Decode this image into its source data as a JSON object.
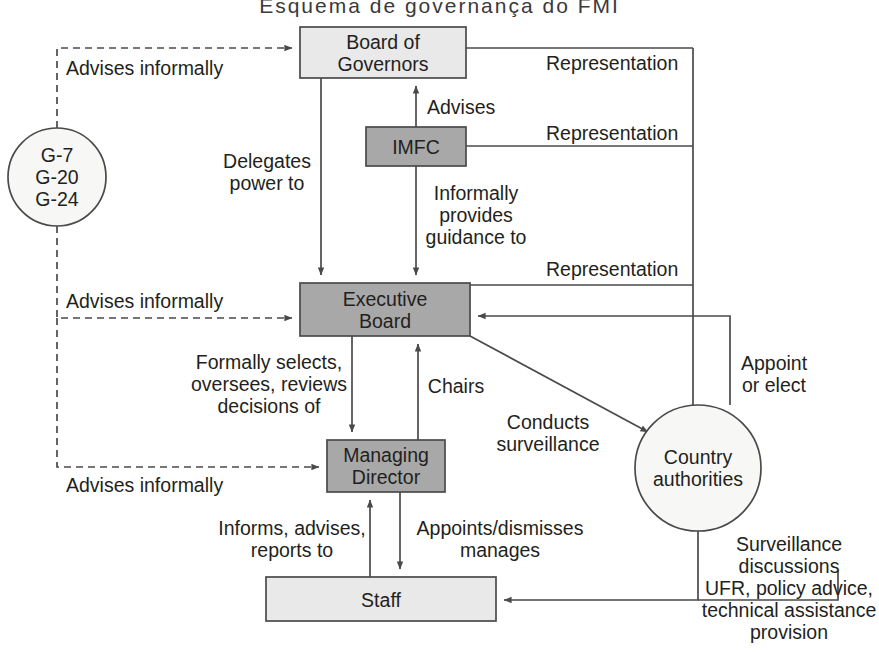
{
  "title": "Esquema de governança do FMI",
  "colors": {
    "box_light": "#e9e9e9",
    "box_dark": "#a8a8a8",
    "stroke": "#4a4a4a",
    "text": "#231f20",
    "circle_fill": "#f7f7f5",
    "background": "#ffffff"
  },
  "nodes": [
    {
      "id": "board-of-governors",
      "label": "Board of\nGovernors",
      "shape": "rect",
      "fill": "light",
      "x": 300,
      "y": 27,
      "w": 166,
      "h": 51
    },
    {
      "id": "imfc",
      "label": "IMFC",
      "shape": "rect",
      "fill": "dark",
      "x": 366,
      "y": 127,
      "w": 100,
      "h": 39
    },
    {
      "id": "executive-board",
      "label": "Executive\nBoard",
      "shape": "rect",
      "fill": "dark",
      "x": 300,
      "y": 283,
      "w": 170,
      "h": 53
    },
    {
      "id": "managing-director",
      "label": "Managing\nDirector",
      "shape": "rect",
      "fill": "dark",
      "x": 327,
      "y": 440,
      "w": 118,
      "h": 52
    },
    {
      "id": "staff",
      "label": "Staff",
      "shape": "rect",
      "fill": "light",
      "x": 266,
      "y": 577,
      "w": 230,
      "h": 44
    },
    {
      "id": "g-groups",
      "label": "G-7\nG-20\nG-24",
      "shape": "circle",
      "fill": "circle",
      "cx": 57,
      "cy": 177,
      "r": 49
    },
    {
      "id": "country-authorities",
      "label": "Country\nauthorities",
      "shape": "circle",
      "fill": "circle",
      "cx": 698,
      "cy": 468,
      "r": 63
    }
  ],
  "edge_labels": [
    {
      "id": "advises-informally-governors",
      "text": "Advises informally",
      "x": 66,
      "y": 57,
      "align": "l"
    },
    {
      "id": "advises-informally-executive-board",
      "text": "Advises informally",
      "x": 66,
      "y": 290,
      "align": "l"
    },
    {
      "id": "advises-informally-managing-director",
      "text": "Advises informally",
      "x": 66,
      "y": 474,
      "align": "l"
    },
    {
      "id": "representation-governors",
      "text": "Representation",
      "x": 546,
      "y": 52,
      "align": "l"
    },
    {
      "id": "representation-imfc",
      "text": "Representation",
      "x": 546,
      "y": 122,
      "align": "l"
    },
    {
      "id": "representation-executive-board",
      "text": "Representation",
      "x": 546,
      "y": 258,
      "align": "l"
    },
    {
      "id": "advises-imfc-to-governors",
      "text": "Advises",
      "x": 427,
      "y": 96,
      "align": "l"
    },
    {
      "id": "delegates-power-to",
      "text": "Delegates\npower to",
      "x": 267,
      "y": 150,
      "align": "c"
    },
    {
      "id": "informally-provides-guidance-to",
      "text": "Informally\nprovides\nguidance to",
      "x": 476,
      "y": 182,
      "align": "c"
    },
    {
      "id": "formally-selects-oversees-reviews",
      "text": "Formally selects,\noversees, reviews\ndecisions of",
      "x": 269,
      "y": 351,
      "align": "c"
    },
    {
      "id": "chairs",
      "text": "Chairs",
      "x": 456,
      "y": 375,
      "align": "c"
    },
    {
      "id": "conducts-surveillance",
      "text": "Conducts\nsurveillance",
      "x": 548,
      "y": 411,
      "align": "c"
    },
    {
      "id": "appoint-or-elect",
      "text": "Appoint\nor elect",
      "x": 774,
      "y": 352,
      "align": "c"
    },
    {
      "id": "informs-advises-reports-to",
      "text": "Informs, advises,\nreports to",
      "x": 292,
      "y": 517,
      "align": "c"
    },
    {
      "id": "appoints-dismisses-manages",
      "text": "Appoints/dismisses\nmanages",
      "x": 500,
      "y": 517,
      "align": "c"
    },
    {
      "id": "surveillance-discussions",
      "text": "Surveillance\ndiscussions\nUFR, policy advice,\ntechnical assistance\nprovision",
      "x": 789,
      "y": 533,
      "align": "c"
    }
  ],
  "edges": [
    {
      "id": "g-to-board-of-governors",
      "style": "dashed",
      "from": "g-groups",
      "to": "board-of-governors"
    },
    {
      "id": "g-to-executive-board",
      "style": "dashed",
      "from": "g-groups",
      "to": "executive-board"
    },
    {
      "id": "g-to-managing-director",
      "style": "dashed",
      "from": "g-groups",
      "to": "managing-director"
    },
    {
      "id": "board-of-governors-to-executive-board",
      "style": "solid",
      "from": "board-of-governors",
      "to": "executive-board"
    },
    {
      "id": "imfc-to-board-of-governors",
      "style": "solid",
      "from": "imfc",
      "to": "board-of-governors"
    },
    {
      "id": "imfc-to-executive-board",
      "style": "solid",
      "from": "imfc",
      "to": "executive-board"
    },
    {
      "id": "board-of-governors-to-country-authorities",
      "style": "solid",
      "from": "board-of-governors",
      "to": "country-authorities"
    },
    {
      "id": "imfc-to-country-authorities",
      "style": "solid",
      "from": "imfc",
      "to": "country-authorities"
    },
    {
      "id": "executive-board-to-country-authorities",
      "style": "solid",
      "from": "executive-board",
      "to": "country-authorities"
    },
    {
      "id": "country-authorities-to-executive-board",
      "style": "solid",
      "from": "country-authorities",
      "to": "executive-board"
    },
    {
      "id": "executive-board-to-managing-director",
      "style": "solid",
      "from": "executive-board",
      "to": "managing-director"
    },
    {
      "id": "managing-director-to-executive-board",
      "style": "solid",
      "from": "managing-director",
      "to": "executive-board"
    },
    {
      "id": "executive-board-surveillance-to-country-authorities",
      "style": "solid",
      "from": "executive-board",
      "to": "country-authorities"
    },
    {
      "id": "staff-to-managing-director",
      "style": "solid",
      "from": "staff",
      "to": "managing-director"
    },
    {
      "id": "managing-director-to-staff",
      "style": "solid",
      "from": "managing-director",
      "to": "staff"
    },
    {
      "id": "country-authorities-to-staff",
      "style": "solid",
      "from": "country-authorities",
      "to": "staff"
    }
  ]
}
